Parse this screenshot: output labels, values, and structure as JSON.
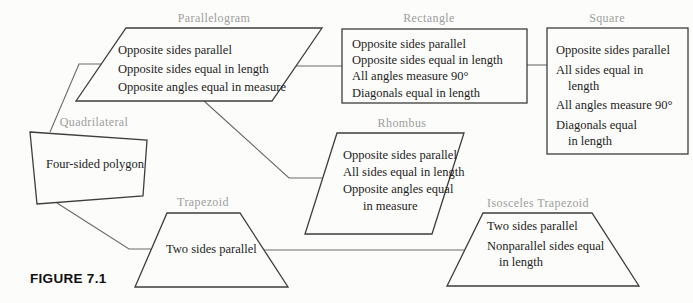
{
  "figure_caption": "FIGURE 7.1",
  "colors": {
    "label_gray": "#9e9e9e",
    "body_text": "#1c1c1c",
    "shape_outline": "#3d3d3d",
    "connector_line": "#6a6a6a",
    "background": "#fcfcfa"
  },
  "nodes": {
    "quadrilateral": {
      "label": "Quadrilateral",
      "shape": "irregular-quadrilateral",
      "lines": [
        "Four-sided polygon"
      ]
    },
    "parallelogram": {
      "label": "Parallelogram",
      "shape": "parallelogram",
      "lines": [
        "Opposite sides parallel",
        "Opposite sides equal in length",
        "Opposite angles equal in measure"
      ]
    },
    "rectangle": {
      "label": "Rectangle",
      "shape": "rectangle",
      "lines": [
        "Opposite sides parallel",
        "Opposite sides equal in length",
        "All angles measure 90°",
        "Diagonals equal in length"
      ]
    },
    "square": {
      "label": "Square",
      "shape": "square",
      "lines": [
        "Opposite sides parallel",
        "All sides equal in",
        "length",
        "All angles measure 90°",
        "Diagonals equal",
        "in length"
      ]
    },
    "rhombus": {
      "label": "Rhombus",
      "shape": "parallelogram",
      "lines": [
        "Opposite sides parallel",
        "All sides equal in length",
        "Opposite angles equal",
        "in measure"
      ]
    },
    "trapezoid": {
      "label": "Trapezoid",
      "shape": "trapezoid",
      "lines": [
        "Two sides parallel"
      ]
    },
    "isosceles_trapezoid": {
      "label": "Isosceles Trapezoid",
      "shape": "trapezoid",
      "lines": [
        "Two sides parallel",
        "Nonparallel sides equal",
        "in length"
      ]
    }
  },
  "edges": [
    {
      "from": "Quadrilateral",
      "to": "Parallelogram"
    },
    {
      "from": "Quadrilateral",
      "to": "Trapezoid"
    },
    {
      "from": "Parallelogram",
      "to": "Rectangle"
    },
    {
      "from": "Parallelogram",
      "to": "Rhombus"
    },
    {
      "from": "Rectangle",
      "to": "Square"
    },
    {
      "from": "Trapezoid",
      "to": "Isosceles Trapezoid"
    }
  ]
}
